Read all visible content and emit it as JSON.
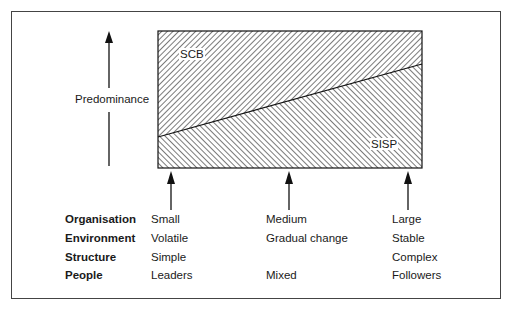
{
  "diagram": {
    "y_axis_label": "Predominance",
    "regions": {
      "upper": {
        "label": "SCB",
        "hatch": "backslash"
      },
      "lower": {
        "label": "SISP",
        "hatch": "forwardslash"
      }
    },
    "divider": {
      "from": {
        "x": 158,
        "y": 137
      },
      "to": {
        "x": 422,
        "y": 64
      }
    },
    "colors": {
      "line": "#1a1a1a",
      "hatch": "#333333",
      "background": "#ffffff"
    }
  },
  "table": {
    "row_labels": [
      "Organisation",
      "Environment",
      "Structure",
      "People"
    ],
    "columns": [
      {
        "position": "left",
        "values": [
          "Small",
          "Volatile",
          "Simple",
          "Leaders"
        ]
      },
      {
        "position": "middle",
        "values": [
          "Medium",
          "Gradual change",
          "",
          "Mixed"
        ]
      },
      {
        "position": "right",
        "values": [
          "Large",
          "Stable",
          "Complex",
          "Followers"
        ]
      }
    ]
  }
}
